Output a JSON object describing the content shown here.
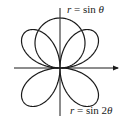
{
  "diagram": {
    "type": "polar-curves",
    "origin_px": [
      60,
      68
    ],
    "scale_px_per_unit": 50,
    "stroke_color": "#1a1a1a",
    "curves": [
      {
        "name": "circle",
        "equation": "r = sin θ",
        "var": "r",
        "eq": " = sin ",
        "arg": "θ"
      },
      {
        "name": "four-leaved rose",
        "equation": "r = sin 2θ",
        "var": "r",
        "eq": " = sin 2",
        "arg": "θ"
      }
    ],
    "axes": {
      "horizontal": {
        "from": [
          14,
          68
        ],
        "to": [
          118,
          68
        ],
        "arrow": true
      },
      "vertical": {
        "from": [
          60,
          8
        ],
        "to": [
          60,
          116
        ],
        "arrow": false
      }
    }
  },
  "labels": {
    "top": {
      "var": "r",
      "rest": " = sin ",
      "theta": "θ"
    },
    "bottom": {
      "var": "r",
      "rest": " = sin 2",
      "theta": "θ"
    }
  }
}
